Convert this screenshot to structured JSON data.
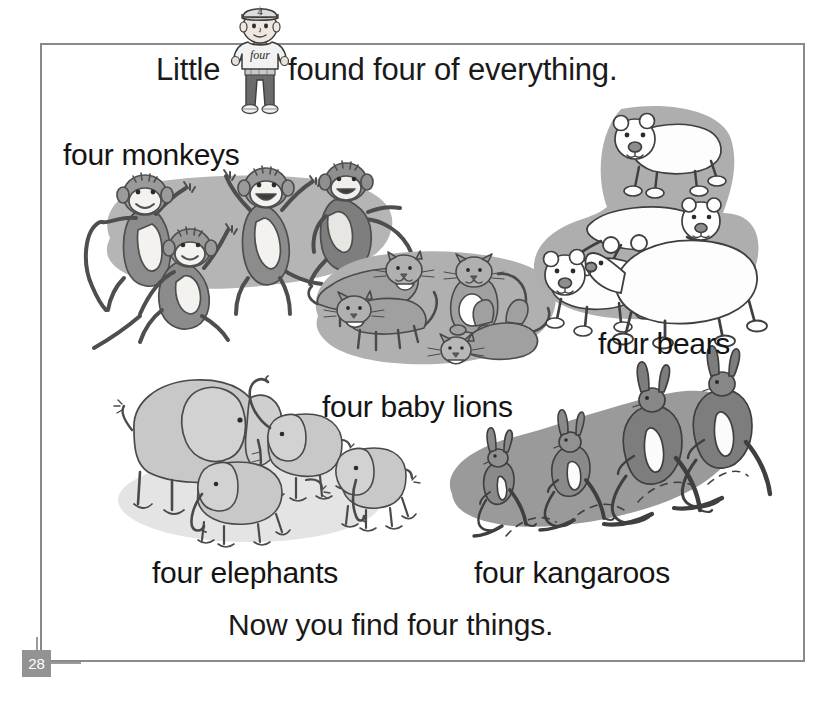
{
  "page": {
    "number": "28",
    "border_color": "#8a8a8a",
    "background": "#ffffff",
    "page_number_badge_color": "#939393"
  },
  "title": {
    "before_figure": "Little",
    "after_figure": "found four of everything."
  },
  "character": {
    "name": "little-four-boy",
    "cap_number": "4",
    "shirt_word": "four",
    "shirt_color": "#f2f2f2",
    "pants_color": "#6b6b6b",
    "skin_color": "#e8e0da"
  },
  "closing_line": "Now you find four things.",
  "scenes": [
    {
      "id": "monkeys",
      "label": "four monkeys",
      "count": 4,
      "animal": "monkey",
      "blob_color": "#b5b5b5",
      "body_color": "#8c8c8c",
      "belly_color": "#f4f2ee"
    },
    {
      "id": "lions",
      "label": "four baby lions",
      "count": 4,
      "animal": "baby lion",
      "blob_color": "#b0b0b0",
      "body_color": "#a0a0a0",
      "belly_color": "#ffffff"
    },
    {
      "id": "bears",
      "label": "four bears",
      "count": 4,
      "animal": "polar bear",
      "blob_color": "#aeaeae",
      "body_color": "#fdfdfd",
      "belly_color": "#ffffff"
    },
    {
      "id": "elephants",
      "label": "four elephants",
      "count": 4,
      "animal": "elephant",
      "blob_color": "#e4e4e4",
      "body_color": "#c8c8c8",
      "belly_color": "#d6d6d6"
    },
    {
      "id": "kangaroos",
      "label": "four kangaroos",
      "count": 4,
      "animal": "kangaroo",
      "blob_color": "#9a9a9a",
      "body_color": "#8a8a8a",
      "belly_color": "#fbfbfb"
    }
  ]
}
